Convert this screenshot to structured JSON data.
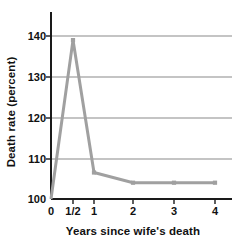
{
  "chart_data": {
    "type": "line",
    "title": "",
    "subtitle": "",
    "xlabel": "Years since wife's death",
    "ylabel": "Death rate (percent)",
    "x": [
      0,
      0.5,
      1,
      2,
      3,
      4
    ],
    "x_tick_labels": [
      "0",
      "1/2",
      "1",
      "2",
      "3",
      "4"
    ],
    "values": [
      100,
      139,
      106.5,
      104,
      104,
      104
    ],
    "series": [
      {
        "name": "Death rate of widowers",
        "values": [
          100,
          139,
          106.5,
          104,
          104,
          104
        ]
      }
    ],
    "ylim": [
      100,
      142
    ],
    "y_ticks": [
      100,
      110,
      120,
      130,
      140
    ],
    "y_tick_labels": [
      "100",
      "110",
      "120",
      "130",
      "140"
    ],
    "grid": "horizontal",
    "grid_values": [
      110,
      120,
      130,
      140
    ],
    "legend": "none",
    "legend_position": "none",
    "annotations": [],
    "colors": {
      "line": "#a0a0a0",
      "marker": "#a0a0a0",
      "grid": "#8a8a8a",
      "axis": "#1a1a1a",
      "text": "#111111",
      "background": "#ffffff"
    },
    "marker_style": "square"
  },
  "axes": {
    "y_title": "Death rate (percent)",
    "x_title": "Years since wife's death",
    "y_labels": [
      "140",
      "130",
      "120",
      "110",
      "100"
    ],
    "x_labels": [
      "0",
      "1/2",
      "1",
      "2",
      "3",
      "4"
    ]
  }
}
